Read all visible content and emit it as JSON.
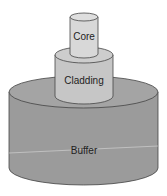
{
  "diagram": {
    "layers": [
      {
        "id": "core",
        "label": "Core",
        "color": "#d6d6d6"
      },
      {
        "id": "cladding",
        "label": "Cladding",
        "color": "#c2c2c2"
      },
      {
        "id": "buffer",
        "label": "Buffer",
        "color": "#9d9d9d"
      }
    ]
  }
}
